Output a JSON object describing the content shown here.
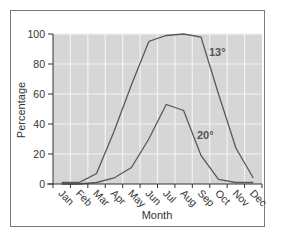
{
  "chart_data": {
    "type": "line",
    "title": "",
    "xlabel": "Month",
    "ylabel": "Percentage",
    "ylim": [
      0,
      100
    ],
    "yticks": [
      0,
      20,
      40,
      60,
      80,
      100
    ],
    "categories": [
      "Jan",
      "Feb",
      "Mar",
      "Apr",
      "May",
      "Jun",
      "Jul",
      "Aug",
      "Sep",
      "Oct",
      "Nov",
      "Dec"
    ],
    "grid": true,
    "legend": "inline labels",
    "series": [
      {
        "name": "13°",
        "values": [
          1,
          1,
          7,
          35,
          66,
          95,
          99,
          100,
          98,
          60,
          24,
          4
        ]
      },
      {
        "name": "20°",
        "values": [
          0,
          0,
          1,
          4,
          11,
          30,
          53,
          49,
          19,
          3,
          1,
          1
        ]
      }
    ],
    "colors": {
      "plot_bg": "#d6d6d6",
      "grid": "#f2f2f2",
      "line": "#5a5a5a",
      "axis": "#333333",
      "frame": "#7a7a7a"
    }
  }
}
